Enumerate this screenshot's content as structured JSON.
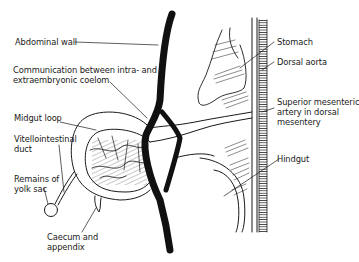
{
  "diagram": {
    "type": "anatomical illustration",
    "stroke_color": "#1a1a1a",
    "background": "#ffffff",
    "labels": {
      "abdominal_wall": "Abdominal wall",
      "communication_line1": "Communication between intra- and",
      "communication_line2": "extraembryonic coelom",
      "midgut_loop": "Midgut loop",
      "vitellointestinal_line1": "Vitellointestinal",
      "vitellointestinal_line2": "duct",
      "remains_line1": "Remains of",
      "remains_line2": "yolk sac",
      "caecum_line1": "Caecum  and",
      "caecum_line2": "appendix",
      "stomach": "Stomach",
      "dorsal_aorta": "Dorsal aorta",
      "sma_line1": "Superior mesenteric",
      "sma_line2": "artery in dorsal",
      "sma_line3": "mesentery",
      "hindgut": "Hindgut"
    }
  }
}
